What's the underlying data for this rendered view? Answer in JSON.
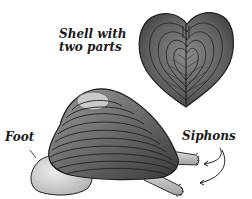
{
  "diagram": {
    "labels": {
      "shell_line1": "Shell with",
      "shell_line2": "two parts",
      "foot": "Foot",
      "siphons": "Siphons"
    },
    "parts": [
      {
        "name": "heart-shaped shell (front view)",
        "label": "Shell with two parts"
      },
      {
        "name": "clam shell (side view)"
      },
      {
        "name": "foot",
        "label": "Foot"
      },
      {
        "name": "upper siphon",
        "label": "Siphons"
      },
      {
        "name": "lower siphon",
        "label": "Siphons"
      }
    ],
    "colors": {
      "shell_fill": "#6e6e6e",
      "shell_dark": "#3a3a3a",
      "shell_light": "#c9c9c9",
      "foot_fill": "#d8d8d8",
      "outline": "#1e1e1e",
      "text": "#1a1a1a",
      "background": "#ffffff"
    }
  }
}
